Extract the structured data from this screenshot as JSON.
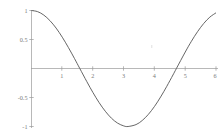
{
  "chart_data": {
    "type": "line",
    "title": "",
    "subtitle": "",
    "xlabel": "",
    "ylabel": "",
    "xlim": [
      0,
      6
    ],
    "ylim": [
      -1,
      1
    ],
    "grid": false,
    "legend": null,
    "axis_style": "centered-origin-cross",
    "line_color": "#555555",
    "axis_color": "#9a9a9a",
    "tick_label_color": "#7a7a7a",
    "background_color": "#ffffff",
    "xticks": [
      1,
      2,
      3,
      4,
      5,
      6
    ],
    "xtick_labels": [
      "1",
      "2",
      "3",
      "4",
      "5",
      "6"
    ],
    "yticks": [
      1,
      0.5,
      -0.5,
      -1
    ],
    "ytick_labels": [
      "1",
      "0.5",
      "-0.5",
      "-1"
    ],
    "series": [
      {
        "name": "cos(x)",
        "x": [
          0,
          0.2,
          0.4,
          0.6,
          0.8,
          1.0,
          1.2,
          1.4,
          1.5708,
          1.8,
          2.0,
          2.2,
          2.4,
          2.6,
          2.8,
          3.0,
          3.1416,
          3.4,
          3.6,
          3.8,
          4.0,
          4.2,
          4.4,
          4.6,
          4.7124,
          5.0,
          5.2,
          5.4,
          5.6,
          5.8,
          6.0
        ],
        "y": [
          1.0,
          0.98,
          0.921,
          0.825,
          0.697,
          0.54,
          0.362,
          0.17,
          0.0,
          -0.227,
          -0.416,
          -0.589,
          -0.737,
          -0.857,
          -0.942,
          -0.99,
          -1.0,
          -0.967,
          -0.897,
          -0.791,
          -0.654,
          -0.49,
          -0.307,
          -0.112,
          0.0,
          0.284,
          0.469,
          0.635,
          0.776,
          0.886,
          0.96
        ]
      }
    ]
  }
}
